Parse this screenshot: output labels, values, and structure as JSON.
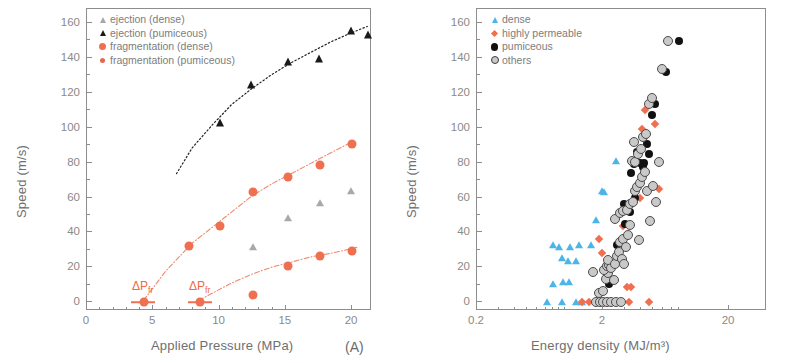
{
  "figure": {
    "panelA_label": "(A)",
    "panelB_label": "(B)"
  },
  "panelA": {
    "xlabel": "Applied Pressure (MPa)",
    "ylabel": "Speed (m/s)",
    "xticks": [
      0,
      5,
      10,
      15,
      20
    ],
    "yticks": [
      0,
      20,
      40,
      60,
      80,
      100,
      120,
      140,
      160
    ],
    "xlim": [
      0,
      21.5
    ],
    "ylim": [
      -5,
      168
    ],
    "annotations": [
      {
        "text": "ΔP",
        "sub": "fr",
        "x": 4.2,
        "y": 9
      },
      {
        "text": "ΔP",
        "sub": "fr",
        "x": 8.5,
        "y": 9
      }
    ],
    "legend": [
      {
        "label": "ejection (dense)",
        "marker": "triangle-gray"
      },
      {
        "label": "ejection (pumiceous)",
        "marker": "triangle-black"
      },
      {
        "label": "fragmentation (dense)",
        "marker": "circle-orange"
      },
      {
        "label": "fragmentation (pumiceous)",
        "marker": "circle-orange-small"
      }
    ]
  },
  "panelB": {
    "xlabel": "Energy density (MJ/m³)",
    "ylabel": "Speed (m/s)",
    "xticks": [
      0.2,
      2,
      20
    ],
    "yticks": [
      0,
      20,
      40,
      60,
      80,
      100,
      120,
      140,
      160
    ],
    "xscale": "log",
    "xlim": [
      0.2,
      40
    ],
    "ylim": [
      -5,
      168
    ],
    "legend": [
      {
        "label": "dense",
        "marker": "triangle-cyan"
      },
      {
        "label": "highly permeable",
        "marker": "diamond-orange"
      },
      {
        "label": "pumiceous",
        "marker": "circle-black"
      },
      {
        "label": "others",
        "marker": "circle-open"
      }
    ]
  },
  "colors": {
    "orange": "#ef7050",
    "black": "#111111",
    "gray_triangle": "#a8a8a8",
    "cyan": "#4bb4e8",
    "others_fill": "#c9c9c9",
    "others_edge": "#4b4b4b",
    "axis": "#8d8d8d",
    "text": "#6f6f6f"
  },
  "chart_data": [
    {
      "type": "scatter",
      "title": "(A) Speed vs Applied Pressure",
      "xlabel": "Applied Pressure (MPa)",
      "ylabel": "Speed (m/s)",
      "xlim": [
        0,
        21.5
      ],
      "ylim": [
        -5,
        168
      ],
      "grid": false,
      "legend_position": "top-left",
      "series": [
        {
          "name": "ejection (pumiceous)",
          "marker": "triangle-black",
          "points": [
            [
              10.0,
              102.5
            ],
            [
              12.4,
              124.5
            ],
            [
              15.2,
              137.5
            ],
            [
              17.5,
              139.5
            ],
            [
              19.9,
              155.5
            ],
            [
              21.2,
              153.0
            ]
          ]
        },
        {
          "name": "ejection (dense)",
          "marker": "triangle-gray",
          "points": [
            [
              12.5,
              31.8
            ],
            [
              15.2,
              48.5
            ],
            [
              17.6,
              57.0
            ],
            [
              19.9,
              63.8
            ]
          ]
        },
        {
          "name": "fragmentation (pumiceous)",
          "marker": "circle-orange",
          "points": [
            [
              4.3,
              0
            ],
            [
              7.7,
              32.0
            ],
            [
              10.0,
              43.5
            ],
            [
              12.5,
              63.0
            ],
            [
              15.2,
              72.0
            ],
            [
              17.6,
              78.8
            ],
            [
              20.0,
              90.5
            ]
          ]
        },
        {
          "name": "fragmentation (dense)",
          "marker": "circle-orange",
          "points": [
            [
              8.5,
              0
            ],
            [
              12.5,
              4.0
            ],
            [
              15.2,
              20.8
            ],
            [
              17.6,
              26.6
            ],
            [
              20.0,
              29.3
            ]
          ]
        }
      ],
      "fit_curves": [
        {
          "name": "ejection fit",
          "style": "dotted-black",
          "points": [
            [
              6.8,
              73
            ],
            [
              8,
              88
            ],
            [
              9.5,
              101
            ],
            [
              11,
              113
            ],
            [
              12.5,
              122
            ],
            [
              14,
              130
            ],
            [
              15.5,
              137
            ],
            [
              17,
              143
            ],
            [
              18.5,
              149
            ],
            [
              20,
              154
            ],
            [
              21.3,
              158
            ]
          ]
        },
        {
          "name": "fragmentation pumiceous fit",
          "style": "dash-dot-orange",
          "points": [
            [
              4.3,
              0
            ],
            [
              5,
              7
            ],
            [
              6,
              17
            ],
            [
              7,
              25
            ],
            [
              8,
              33
            ],
            [
              9.5,
              42
            ],
            [
              11,
              51
            ],
            [
              12.5,
              60
            ],
            [
              14,
              67
            ],
            [
              15.5,
              73
            ],
            [
              17,
              79
            ],
            [
              18.5,
              85
            ],
            [
              20.3,
              92
            ]
          ]
        },
        {
          "name": "fragmentation dense fit",
          "style": "dash-dot-orange",
          "points": [
            [
              8.5,
              0
            ],
            [
              9.5,
              4
            ],
            [
              11,
              10
            ],
            [
              12.5,
              15
            ],
            [
              14,
              19
            ],
            [
              15.5,
              22
            ],
            [
              17,
              25
            ],
            [
              18.5,
              27
            ],
            [
              20.5,
              30.5
            ]
          ]
        }
      ],
      "annotations": [
        "ΔPfr at ~4.2 MPa (pumiceous)",
        "ΔPfr at ~8.5 MPa (dense)"
      ]
    },
    {
      "type": "scatter",
      "title": "(B) Speed vs Energy density",
      "xlabel": "Energy density (MJ/m³)",
      "ylabel": "Speed (m/s)",
      "xscale": "log",
      "xlim": [
        0.2,
        40
      ],
      "ylim": [
        -5,
        168
      ],
      "grid": false,
      "legend_position": "top-left",
      "series": [
        {
          "name": "dense",
          "marker": "triangle-cyan",
          "points": [
            [
              0.72,
              0
            ],
            [
              0.95,
              0
            ],
            [
              1.22,
              0
            ],
            [
              1.35,
              0
            ],
            [
              0.8,
              10.5
            ],
            [
              0.97,
              11.5
            ],
            [
              1.08,
              11.5
            ],
            [
              1.05,
              23.5
            ],
            [
              1.22,
              23.5
            ],
            [
              0.95,
              25.5
            ],
            [
              0.8,
              33.0
            ],
            [
              0.9,
              31.5
            ],
            [
              1.1,
              31.5
            ],
            [
              1.3,
              33.0
            ],
            [
              1.95,
              64.0
            ],
            [
              2.05,
              63.0
            ],
            [
              1.75,
              47.0
            ],
            [
              2.55,
              81.0
            ],
            [
              1.6,
              33.0
            ]
          ]
        },
        {
          "name": "highly permeable",
          "marker": "diamond-orange",
          "points": [
            [
              1.35,
              0
            ],
            [
              2.0,
              0
            ],
            [
              2.3,
              0
            ],
            [
              2.6,
              0
            ],
            [
              3.2,
              0
            ],
            [
              4.6,
              0
            ],
            [
              1.55,
              0
            ],
            [
              3.1,
              8.8
            ],
            [
              3.35,
              8.5
            ],
            [
              2.1,
              16.5
            ],
            [
              1.95,
              28.5
            ],
            [
              1.85,
              36.5
            ],
            [
              2.6,
              26.5
            ],
            [
              2.9,
              43.5
            ],
            [
              3.9,
              60.0
            ],
            [
              5.6,
              65.0
            ],
            [
              5.2,
              102.0
            ],
            [
              4.1,
              99.5
            ],
            [
              4.3,
              110.0
            ]
          ]
        },
        {
          "name": "pumiceous",
          "marker": "circle-black",
          "points": [
            [
              2.05,
              0
            ],
            [
              2.35,
              0
            ],
            [
              1.95,
              0
            ],
            [
              2.25,
              10.5
            ],
            [
              2.6,
              33.0
            ],
            [
              3.25,
              51.5
            ],
            [
              3.6,
              59.5
            ],
            [
              3.0,
              45.0
            ],
            [
              3.35,
              74.0
            ],
            [
              3.9,
              79.5
            ],
            [
              4.2,
              80.0
            ],
            [
              4.5,
              90.5
            ],
            [
              4.9,
              107.0
            ],
            [
              5.2,
              113.5
            ],
            [
              6.3,
              132.0
            ],
            [
              8.0,
              149.5
            ],
            [
              4.15,
              77.5
            ],
            [
              3.55,
              79.0
            ],
            [
              2.95,
              56.5
            ],
            [
              4.6,
              85.0
            ],
            [
              3.75,
              86.0
            ]
          ]
        },
        {
          "name": "others",
          "marker": "circle-open",
          "points": [
            [
              1.75,
              0
            ],
            [
              1.9,
              0
            ],
            [
              2.0,
              0
            ],
            [
              2.15,
              0
            ],
            [
              2.3,
              0
            ],
            [
              2.55,
              0
            ],
            [
              2.8,
              0
            ],
            [
              1.85,
              5.5
            ],
            [
              2.0,
              6.5
            ],
            [
              2.1,
              13.5
            ],
            [
              2.2,
              16.5
            ],
            [
              2.05,
              18.5
            ],
            [
              2.15,
              21.0
            ],
            [
              2.25,
              21.5
            ],
            [
              2.3,
              19.5
            ],
            [
              2.2,
              24.5
            ],
            [
              1.65,
              17.5
            ],
            [
              2.45,
              12.5
            ],
            [
              2.5,
              22.0
            ],
            [
              2.6,
              26.5
            ],
            [
              2.7,
              29.0
            ],
            [
              2.75,
              34.5
            ],
            [
              2.9,
              36.5
            ],
            [
              2.85,
              25.0
            ],
            [
              2.95,
              22.0
            ],
            [
              3.05,
              31.5
            ],
            [
              3.15,
              38.5
            ],
            [
              3.25,
              44.0
            ],
            [
              2.5,
              47.5
            ],
            [
              2.75,
              51.0
            ],
            [
              2.9,
              52.5
            ],
            [
              3.1,
              53.0
            ],
            [
              3.3,
              56.5
            ],
            [
              3.45,
              57.5
            ],
            [
              3.6,
              64.0
            ],
            [
              3.75,
              66.0
            ],
            [
              3.95,
              68.5
            ],
            [
              4.1,
              72.0
            ],
            [
              4.3,
              74.5
            ],
            [
              3.55,
              92.0
            ],
            [
              3.4,
              81.0
            ],
            [
              3.6,
              80.5
            ],
            [
              3.8,
              85.0
            ],
            [
              4.0,
              88.0
            ],
            [
              4.15,
              94.5
            ],
            [
              4.35,
              96.5
            ],
            [
              4.6,
              113.5
            ],
            [
              4.9,
              117.0
            ],
            [
              5.6,
              80.5
            ],
            [
              5.3,
              57.5
            ],
            [
              5.9,
              133.5
            ],
            [
              6.6,
              149.5
            ],
            [
              4.45,
              63.5
            ],
            [
              5.0,
              66.5
            ],
            [
              4.75,
              46.5
            ],
            [
              3.85,
              35.5
            ]
          ]
        }
      ]
    }
  ]
}
